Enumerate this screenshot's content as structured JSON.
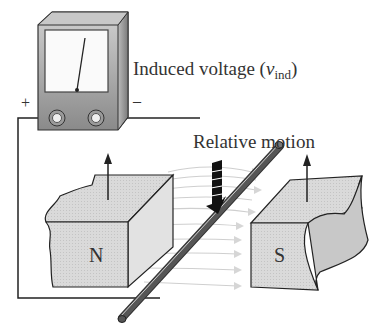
{
  "diagram": {
    "labels": {
      "induced_voltage_prefix": "Induced voltage (",
      "induced_voltage_symbol": "v",
      "induced_voltage_subscript": "ind",
      "induced_voltage_suffix": ")",
      "relative_motion": "Relative motion",
      "positive_terminal": "+",
      "negative_terminal": "–",
      "north_pole": "N",
      "south_pole": "S"
    },
    "components": [
      {
        "name": "voltmeter",
        "description": "Analog meter with needle and two terminals"
      },
      {
        "name": "north-magnet",
        "pole": "N"
      },
      {
        "name": "south-magnet",
        "pole": "S"
      },
      {
        "name": "conductor-rod",
        "description": "Diagonal conductor crossing the field"
      },
      {
        "name": "field-lines",
        "direction": "N to S"
      },
      {
        "name": "motion-arrow",
        "direction": "down"
      }
    ],
    "colors": {
      "magnet_fill": "#d8d8d8",
      "meter_body": "#a8a8a8",
      "wire": "#222222",
      "field_lines": "#cfcfcf",
      "arrow": "#111111"
    }
  }
}
